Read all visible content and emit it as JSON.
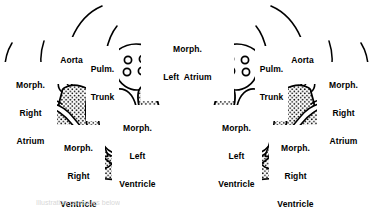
{
  "figure": {
    "background_color": "#ffffff",
    "ink_color": "#000000",
    "panels": [
      {
        "id": "left-panel",
        "side": "left",
        "labels": {
          "aorta": "Aorta",
          "pulm_trunk_line1": "Pulm.",
          "pulm_trunk_line2": "Trunk",
          "morph_right_atrium_line1": "Morph.",
          "morph_right_atrium_line2": "Right",
          "morph_right_atrium_line3": "Atrium",
          "morph_left_atrium_line1": "Morph.",
          "morph_left_atrium_line2": "Left  Atrium",
          "morph_right_ventricle_line1": "Morph.",
          "morph_right_ventricle_line2": "Right",
          "morph_right_ventricle_line3": "Ventricle",
          "morph_left_ventricle_line1": "Morph.",
          "morph_left_ventricle_line2": "Left",
          "morph_left_ventricle_line3": "Ventricle"
        },
        "pulmonary_vein_count": 4
      },
      {
        "id": "right-panel",
        "side": "right",
        "labels": {
          "aorta": "Aorta",
          "pulm_trunk_line1": "Pulm.",
          "pulm_trunk_line2": "Trunk",
          "morph_right_atrium_line1": "Morph.",
          "morph_right_atrium_line2": "Right",
          "morph_right_atrium_line3": "Atrium",
          "morph_right_ventricle_line1": "Morph.",
          "morph_right_ventricle_line2": "Right",
          "morph_right_ventricle_line3": "Ventricle",
          "morph_left_ventricle_line1": "Morph.",
          "morph_left_ventricle_line2": "Left",
          "morph_left_ventricle_line3": "Ventricle"
        },
        "pulmonary_vein_count": 4
      }
    ],
    "shared_labels": {
      "morph_left_atrium_line1": "Morph.",
      "morph_left_atrium_line2": "Left  Atrium"
    },
    "caption": "Illustration continues below"
  }
}
